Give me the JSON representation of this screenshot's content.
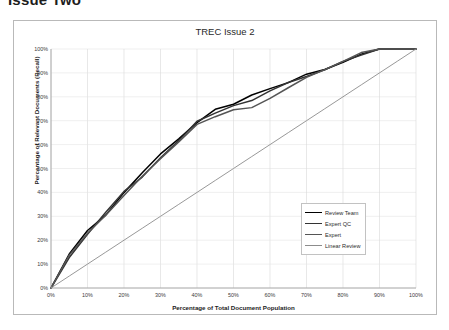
{
  "page": {
    "heading": "Issue Two"
  },
  "chart": {
    "title": "TREC Issue 2",
    "xlabel": "Percentage of Total Document Population",
    "ylabel": "Percentage of Relevant Documents (Recall)",
    "xticks": [
      "0%",
      "10%",
      "20%",
      "30%",
      "40%",
      "50%",
      "60%",
      "70%",
      "80%",
      "90%",
      "100%"
    ],
    "yticks": [
      "0%",
      "10%",
      "20%",
      "30%",
      "40%",
      "50%",
      "60%",
      "70%",
      "80%",
      "90%",
      "100%"
    ],
    "legend": [
      {
        "label": "Review Team",
        "color": "#000000"
      },
      {
        "label": "Expert QC",
        "color": "#333333"
      },
      {
        "label": "Expert",
        "color": "#555555"
      },
      {
        "label": "Linear Review",
        "color": "#8c8c8c"
      }
    ]
  },
  "chart_data": {
    "type": "line",
    "title": "TREC Issue 2",
    "xlabel": "Percentage of Total Document Population",
    "ylabel": "Percentage of Relevant Documents (Recall)",
    "xlim": [
      0,
      100
    ],
    "ylim": [
      0,
      100
    ],
    "grid": true,
    "legend_position": "inside-lower-right",
    "x": [
      0,
      5,
      10,
      15,
      20,
      25,
      30,
      35,
      40,
      45,
      50,
      55,
      60,
      65,
      70,
      75,
      80,
      85,
      90,
      95,
      100
    ],
    "series": [
      {
        "name": "Review Team",
        "color": "#000000",
        "values": [
          0,
          14,
          24,
          31,
          40,
          48,
          56,
          63,
          70,
          74,
          77,
          80,
          83,
          86,
          89,
          92,
          95,
          98,
          100,
          100,
          100
        ]
      },
      {
        "name": "Expert QC",
        "color": "#333333",
        "values": [
          0,
          13,
          23,
          31,
          40,
          47,
          55,
          62,
          69,
          73,
          76,
          79,
          82,
          86,
          89,
          92,
          95,
          98,
          100,
          100,
          100
        ]
      },
      {
        "name": "Expert",
        "color": "#555555",
        "values": [
          0,
          13,
          23,
          30,
          39,
          46,
          54,
          61,
          68,
          72,
          74,
          76,
          80,
          84,
          88,
          91,
          95,
          98,
          100,
          100,
          100
        ]
      },
      {
        "name": "Linear Review",
        "color": "#8c8c8c",
        "values": [
          0,
          5,
          10,
          15,
          20,
          25,
          30,
          35,
          40,
          45,
          50,
          55,
          60,
          65,
          70,
          75,
          80,
          85,
          90,
          95,
          100
        ]
      }
    ]
  }
}
